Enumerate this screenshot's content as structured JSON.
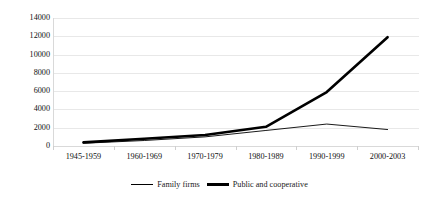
{
  "chart_data": {
    "type": "line",
    "title": "",
    "xlabel": "",
    "ylabel": "",
    "categories": [
      "1945-1959",
      "1960-1969",
      "1970-1979",
      "1980-1989",
      "1990-1999",
      "2000-2003"
    ],
    "yticks": [
      0,
      2000,
      4000,
      6000,
      8000,
      10000,
      12000,
      14000
    ],
    "ylim": [
      0,
      14000
    ],
    "grid": true,
    "legend_position": "bottom",
    "series": [
      {
        "name": "Family firms",
        "style": "thin",
        "color": "#000000",
        "values": [
          300,
          600,
          1000,
          1700,
          2400,
          1800
        ]
      },
      {
        "name": "Public and cooperative",
        "style": "thick",
        "color": "#000000",
        "values": [
          400,
          800,
          1200,
          2100,
          5900,
          11900
        ]
      }
    ]
  }
}
